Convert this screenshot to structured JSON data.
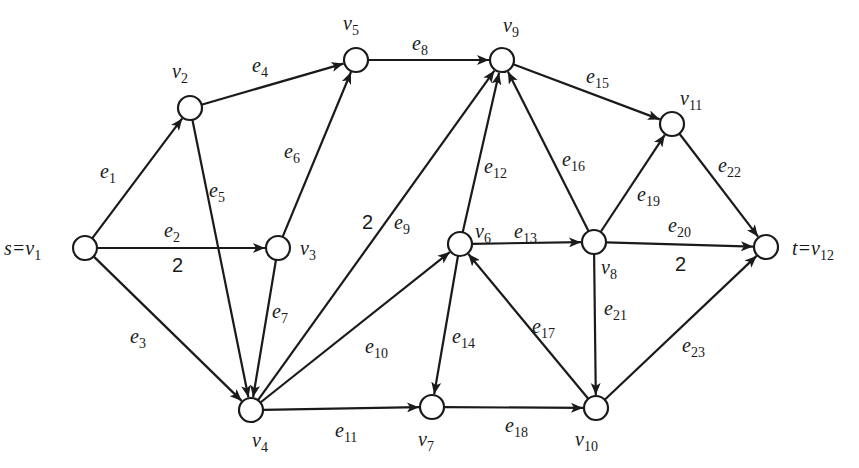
{
  "graph": {
    "type": "directed-network",
    "source": "v1",
    "sink": "v12",
    "colors": {
      "stroke": "#1a1a1a",
      "node_fill": "#ffffff",
      "background": "#ffffff"
    },
    "nodes": [
      {
        "id": "v1",
        "label": "s=v",
        "sub": "1",
        "x": 85,
        "y": 248,
        "lx": 4,
        "ly": 255
      },
      {
        "id": "v2",
        "label": "v",
        "sub": "2",
        "x": 190,
        "y": 108,
        "lx": 172,
        "ly": 78
      },
      {
        "id": "v3",
        "label": "v",
        "sub": "3",
        "x": 278,
        "y": 248,
        "lx": 300,
        "ly": 255
      },
      {
        "id": "v4",
        "label": "v",
        "sub": "4",
        "x": 251,
        "y": 410,
        "lx": 252,
        "ly": 447
      },
      {
        "id": "v5",
        "label": "v",
        "sub": "5",
        "x": 356,
        "y": 60,
        "lx": 343,
        "ly": 30
      },
      {
        "id": "v6",
        "label": "v",
        "sub": "6",
        "x": 460,
        "y": 244,
        "lx": 475,
        "ly": 238
      },
      {
        "id": "v7",
        "label": "v",
        "sub": "7",
        "x": 432,
        "y": 407,
        "lx": 418,
        "ly": 446
      },
      {
        "id": "v8",
        "label": "v",
        "sub": "8",
        "x": 594,
        "y": 242,
        "lx": 601,
        "ly": 274
      },
      {
        "id": "v9",
        "label": "v",
        "sub": "9",
        "x": 502,
        "y": 60,
        "lx": 503,
        "ly": 32
      },
      {
        "id": "v10",
        "label": "v",
        "sub": "10",
        "x": 596,
        "y": 408,
        "lx": 575,
        "ly": 446
      },
      {
        "id": "v11",
        "label": "v",
        "sub": "11",
        "x": 672,
        "y": 124,
        "lx": 680,
        "ly": 105
      },
      {
        "id": "v12",
        "label": "t=v",
        "sub": "12",
        "x": 766,
        "y": 247,
        "lx": 792,
        "ly": 255
      }
    ],
    "edges": [
      {
        "id": "e1",
        "from": "v1",
        "to": "v2",
        "label": "e",
        "sub": "1",
        "lx": 100,
        "ly": 178
      },
      {
        "id": "e2",
        "from": "v1",
        "to": "v3",
        "label": "e",
        "sub": "2",
        "lx": 164,
        "ly": 237,
        "capacity": "2",
        "cx": 172,
        "cy": 272
      },
      {
        "id": "e3",
        "from": "v1",
        "to": "v4",
        "label": "e",
        "sub": "3",
        "lx": 130,
        "ly": 343
      },
      {
        "id": "e4",
        "from": "v2",
        "to": "v5",
        "label": "e",
        "sub": "4",
        "lx": 252,
        "ly": 72
      },
      {
        "id": "e5",
        "from": "v2",
        "to": "v4",
        "label": "e",
        "sub": "5",
        "lx": 209,
        "ly": 197
      },
      {
        "id": "e6",
        "from": "v3",
        "to": "v5",
        "label": "e",
        "sub": "6",
        "lx": 284,
        "ly": 158
      },
      {
        "id": "e7",
        "from": "v3",
        "to": "v4",
        "label": "e",
        "sub": "7",
        "lx": 272,
        "ly": 318
      },
      {
        "id": "e8",
        "from": "v5",
        "to": "v9",
        "label": "e",
        "sub": "8",
        "lx": 412,
        "ly": 50
      },
      {
        "id": "e9",
        "from": "v4",
        "to": "v9",
        "label": "e",
        "sub": "9",
        "lx": 394,
        "ly": 229,
        "capacity": "2",
        "cx": 362,
        "cy": 229
      },
      {
        "id": "e10",
        "from": "v4",
        "to": "v6",
        "label": "e",
        "sub": "10",
        "lx": 365,
        "ly": 353
      },
      {
        "id": "e11",
        "from": "v4",
        "to": "v7",
        "label": "e",
        "sub": "11",
        "lx": 335,
        "ly": 437
      },
      {
        "id": "e12",
        "from": "v6",
        "to": "v9",
        "label": "e",
        "sub": "12",
        "lx": 484,
        "ly": 173
      },
      {
        "id": "e13",
        "from": "v6",
        "to": "v8",
        "label": "e",
        "sub": "13",
        "lx": 514,
        "ly": 238
      },
      {
        "id": "e14",
        "from": "v6",
        "to": "v7",
        "label": "e",
        "sub": "14",
        "lx": 452,
        "ly": 343
      },
      {
        "id": "e15",
        "from": "v9",
        "to": "v11",
        "label": "e",
        "sub": "15",
        "lx": 586,
        "ly": 83
      },
      {
        "id": "e16",
        "from": "v8",
        "to": "v9",
        "label": "e",
        "sub": "16",
        "lx": 562,
        "ly": 166
      },
      {
        "id": "e17",
        "from": "v10",
        "to": "v6",
        "label": "e",
        "sub": "17",
        "lx": 532,
        "ly": 333
      },
      {
        "id": "e18",
        "from": "v7",
        "to": "v10",
        "label": "e",
        "sub": "18",
        "lx": 505,
        "ly": 432
      },
      {
        "id": "e19",
        "from": "v8",
        "to": "v11",
        "label": "e",
        "sub": "19",
        "lx": 637,
        "ly": 201
      },
      {
        "id": "e20",
        "from": "v8",
        "to": "v12",
        "label": "e",
        "sub": "20",
        "lx": 668,
        "ly": 232,
        "capacity": "2",
        "cx": 675,
        "cy": 271
      },
      {
        "id": "e21",
        "from": "v8",
        "to": "v10",
        "label": "e",
        "sub": "21",
        "lx": 604,
        "ly": 315
      },
      {
        "id": "e22",
        "from": "v11",
        "to": "v12",
        "label": "e",
        "sub": "22",
        "lx": 718,
        "ly": 172
      },
      {
        "id": "e23",
        "from": "v10",
        "to": "v12",
        "label": "e",
        "sub": "23",
        "lx": 682,
        "ly": 352
      }
    ]
  }
}
